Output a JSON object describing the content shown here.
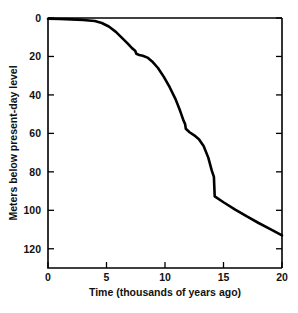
{
  "figure": {
    "name": "sea-level-curve-figure",
    "background": "#ffffff",
    "line_color": "#000000",
    "partial_caption": ""
  },
  "chart_data": {
    "type": "line",
    "title": "",
    "xlabel": "Time  (thousands of years ago)",
    "ylabel": "Meters below present-day level",
    "xlim": [
      0,
      20
    ],
    "ylim": [
      0,
      130
    ],
    "y_inverted": true,
    "grid": false,
    "legend": null,
    "xticks": [
      0,
      5,
      10,
      15,
      20
    ],
    "xticklabels": [
      "0",
      "5",
      "10",
      "15",
      "20"
    ],
    "yticks": [
      0,
      20,
      40,
      60,
      80,
      100,
      120
    ],
    "yticklabels": [
      "0",
      "20",
      "40",
      "60",
      "80",
      "100",
      "120"
    ],
    "series": [
      {
        "name": "sea level",
        "x": [
          0.0,
          1.0,
          2.0,
          3.0,
          4.0,
          4.6,
          5.2,
          5.8,
          6.3,
          6.8,
          7.2,
          7.45,
          7.55,
          7.8,
          8.1,
          8.5,
          8.9,
          9.4,
          9.9,
          10.4,
          10.9,
          11.3,
          11.6,
          11.72,
          11.78,
          12.1,
          12.5,
          12.9,
          13.3,
          13.7,
          14.0,
          14.18,
          14.25,
          15.0,
          16.0,
          17.0,
          18.0,
          19.0,
          20.0
        ],
        "y": [
          0.4,
          0.5,
          0.7,
          1.0,
          1.6,
          2.6,
          4.4,
          7.2,
          10.2,
          13.2,
          15.8,
          17.0,
          18.6,
          19.2,
          19.6,
          20.6,
          22.6,
          26.0,
          30.6,
          36.0,
          42.2,
          48.4,
          53.6,
          55.2,
          57.6,
          59.4,
          61.0,
          63.0,
          66.6,
          72.6,
          79.4,
          82.6,
          92.8,
          95.8,
          99.6,
          103.2,
          106.6,
          109.8,
          113.0
        ]
      }
    ]
  }
}
